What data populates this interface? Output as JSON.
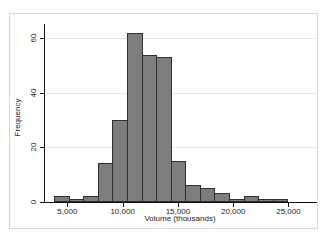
{
  "figure": {
    "background": "#ffffff",
    "border_color": "#d8d8d8"
  },
  "chart_data": {
    "type": "bar",
    "subtype": "histogram",
    "title": "",
    "xlabel": "Volume (thousands)",
    "ylabel": "Frequency",
    "grid": true,
    "legend": false,
    "bin_start": 3800,
    "bin_width": 1319,
    "frequencies": [
      2,
      1,
      2,
      14,
      30,
      62,
      54,
      53,
      15,
      6,
      5,
      3,
      1,
      2,
      1,
      1
    ],
    "x_ticks": [
      {
        "value": 5000,
        "label": "5,000"
      },
      {
        "value": 10000,
        "label": "10,000"
      },
      {
        "value": 15000,
        "label": "15,000"
      },
      {
        "value": 20000,
        "label": "20,000"
      },
      {
        "value": 25000,
        "label": "25,000"
      }
    ],
    "y_ticks": [
      {
        "value": 0,
        "label": "0"
      },
      {
        "value": 20,
        "label": "20"
      },
      {
        "value": 40,
        "label": "40"
      },
      {
        "value": 60,
        "label": "60"
      }
    ],
    "xlim": [
      2889,
      27536
    ],
    "ylim": [
      0,
      65.3
    ],
    "colors": {
      "bar_fill": "#7d7d7d",
      "bar_border": "#2f2f2f",
      "gridline": "#e4e9ea",
      "axis": "#111111",
      "text": "#1a1a1a"
    }
  }
}
